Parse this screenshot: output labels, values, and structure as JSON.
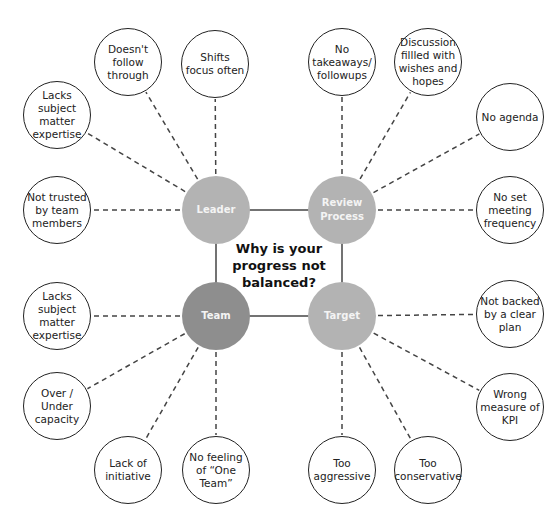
{
  "title": "Why is your progress not balanced?",
  "colors": {
    "hub_light": "#b3b3b3",
    "hub_dark": "#8e8e8e",
    "outline": "#222222",
    "connector": "#444444"
  },
  "hubs": [
    {
      "id": "leader",
      "label": "Leader",
      "x": 216,
      "y": 210,
      "color": "#b3b3b3"
    },
    {
      "id": "review",
      "label": "Review Process",
      "x": 342,
      "y": 210,
      "color": "#b3b3b3"
    },
    {
      "id": "team",
      "label": "Team",
      "x": 216,
      "y": 316,
      "color": "#8e8e8e"
    },
    {
      "id": "target",
      "label": "Target",
      "x": 342,
      "y": 316,
      "color": "#b3b3b3"
    }
  ],
  "leaves": [
    {
      "hub": "leader",
      "label": "Doesn't follow through",
      "x": 128,
      "y": 62
    },
    {
      "hub": "leader",
      "label": "Shifts focus often",
      "x": 215,
      "y": 64
    },
    {
      "hub": "leader",
      "label": "Lacks subject matter expertise",
      "x": 57,
      "y": 115
    },
    {
      "hub": "leader",
      "label": "Not trusted by team members",
      "x": 57,
      "y": 210
    },
    {
      "hub": "review",
      "label": "No takeaways/ followups",
      "x": 342,
      "y": 62
    },
    {
      "hub": "review",
      "label": "Discussion fillled with wishes and hopes",
      "x": 428,
      "y": 62
    },
    {
      "hub": "review",
      "label": "No agenda",
      "x": 510,
      "y": 117
    },
    {
      "hub": "review",
      "label": "No set meeting frequency",
      "x": 510,
      "y": 210
    },
    {
      "hub": "team",
      "label": "Lacks subject matter expertise",
      "x": 57,
      "y": 316
    },
    {
      "hub": "team",
      "label": "Over / Under capacity",
      "x": 57,
      "y": 406
    },
    {
      "hub": "team",
      "label": "Lack of initiative",
      "x": 128,
      "y": 470
    },
    {
      "hub": "team",
      "label": "No feeling of “One Team”",
      "x": 216,
      "y": 470
    },
    {
      "hub": "target",
      "label": "Not backed by a clear plan",
      "x": 510,
      "y": 314
    },
    {
      "hub": "target",
      "label": "Wrong measure of KPI",
      "x": 510,
      "y": 407
    },
    {
      "hub": "target",
      "label": "Too aggressive",
      "x": 342,
      "y": 470
    },
    {
      "hub": "target",
      "label": "Too conservative",
      "x": 428,
      "y": 470
    }
  ]
}
